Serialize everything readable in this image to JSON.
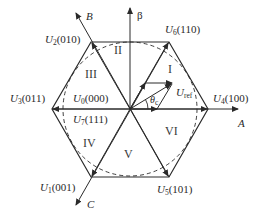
{
  "diagram": {
    "title": "",
    "type": "space-vector-hexagon",
    "center": [
      130,
      109
    ],
    "axes": {
      "A": "A",
      "B": "B",
      "C": "C",
      "beta": "β"
    },
    "vectors": [
      {
        "name": "U",
        "sub": "4",
        "code": "(100)"
      },
      {
        "name": "U",
        "sub": "6",
        "code": "(110)"
      },
      {
        "name": "U",
        "sub": "2",
        "code": "(010)"
      },
      {
        "name": "U",
        "sub": "3",
        "code": "(011)"
      },
      {
        "name": "U",
        "sub": "1",
        "code": "(001)"
      },
      {
        "name": "U",
        "sub": "5",
        "code": "(101)"
      },
      {
        "name": "U",
        "sub": "0",
        "code": "(000)"
      },
      {
        "name": "U",
        "sub": "7",
        "code": "(111)"
      }
    ],
    "sectors": [
      "I",
      "II",
      "III",
      "IV",
      "V",
      "VI"
    ],
    "reference": {
      "name": "U",
      "sub": "ref"
    },
    "angle": {
      "name": "θ",
      "sub": "c"
    },
    "colors": {
      "line": "#2a2a2a",
      "text": "#2a2a2a",
      "background": "#ffffff"
    }
  }
}
